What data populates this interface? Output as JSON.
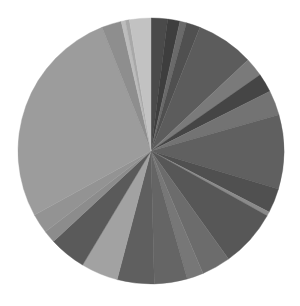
{
  "chart_data": {
    "type": "pie",
    "title": "",
    "legend": "none",
    "center": [
      151,
      151
    ],
    "radius": 133,
    "start_angle_deg": 0,
    "direction": "clockwise",
    "slices": [
      {
        "value": 2.0,
        "color": "#4a4a4a"
      },
      {
        "value": 1.5,
        "color": "#3e3e3e"
      },
      {
        "value": 0.8,
        "color": "#6a6a6a"
      },
      {
        "value": 1.7,
        "color": "#505050"
      },
      {
        "value": 7.0,
        "color": "#5c5c5c"
      },
      {
        "value": 2.3,
        "color": "#7a7a7a"
      },
      {
        "value": 2.3,
        "color": "#454545"
      },
      {
        "value": 3.0,
        "color": "#737373"
      },
      {
        "value": 9.0,
        "color": "#606060"
      },
      {
        "value": 3.0,
        "color": "#505050"
      },
      {
        "value": 0.5,
        "color": "#8a8a8a"
      },
      {
        "value": 7.0,
        "color": "#575757"
      },
      {
        "value": 3.5,
        "color": "#6c6c6c"
      },
      {
        "value": 2.0,
        "color": "#777777"
      },
      {
        "value": 4.0,
        "color": "#656565"
      },
      {
        "value": 4.5,
        "color": "#5f5f5f"
      },
      {
        "value": 4.5,
        "color": "#a2a2a2"
      },
      {
        "value": 4.5,
        "color": "#5a5a5a"
      },
      {
        "value": 1.5,
        "color": "#8c8c8c"
      },
      {
        "value": 2.4,
        "color": "#939393"
      },
      {
        "value": 27.0,
        "color": "#9c9c9c"
      },
      {
        "value": 2.4,
        "color": "#8e8e8e"
      },
      {
        "value": 0.5,
        "color": "#bcbcbc"
      },
      {
        "value": 0.5,
        "color": "#a8a8a8"
      },
      {
        "value": 2.6,
        "color": "#c2c2c2"
      }
    ]
  }
}
